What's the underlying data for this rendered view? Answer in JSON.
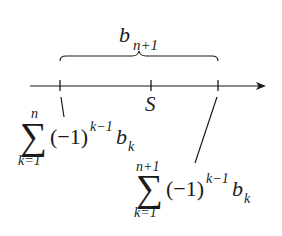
{
  "diagram": {
    "type": "number-line",
    "colors": {
      "ink": "#1a1a1a",
      "background": "#ffffff"
    },
    "brace_label": {
      "base": "b",
      "subscript": "n+1"
    },
    "ticks": [
      {
        "id": "left",
        "x": 60
      },
      {
        "id": "middle",
        "x": 151,
        "label": "S"
      },
      {
        "id": "right",
        "x": 218
      }
    ],
    "middle_label": "S",
    "left_sum": {
      "sigma": "∑",
      "upper": "n",
      "lower": "k=1",
      "paren": "(−1)",
      "exponent": "k−1",
      "term": "b",
      "term_sub": "k"
    },
    "right_sum": {
      "sigma": "∑",
      "upper": "n+1",
      "lower": "k=1",
      "paren": "(−1)",
      "exponent": "k−1",
      "term": "b",
      "term_sub": "k"
    }
  }
}
